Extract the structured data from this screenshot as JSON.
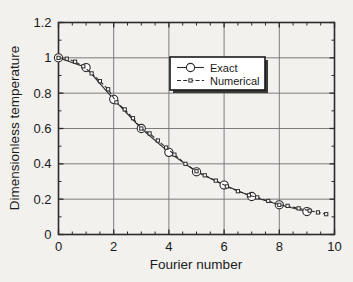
{
  "chart_data": {
    "type": "line",
    "title": "",
    "xlabel": "Fourier number",
    "ylabel": "Dimensionless temperature",
    "xlim": [
      0,
      10
    ],
    "ylim": [
      0,
      1.2
    ],
    "xticks": [
      0,
      2,
      4,
      6,
      8,
      10
    ],
    "xtick_labels": [
      "0",
      "2",
      "4",
      "6",
      "8",
      "10"
    ],
    "yticks": [
      0,
      0.2,
      0.4,
      0.6,
      0.8,
      1,
      1.2
    ],
    "ytick_labels": [
      "0",
      "0.2",
      "0.4",
      "0.6",
      "0.8",
      "1",
      "1.2"
    ],
    "xminor_ticks": [
      0.5,
      1,
      1.5,
      2.5,
      3,
      3.5,
      4.5,
      5,
      5.5,
      6.5,
      7,
      7.5,
      8.5,
      9,
      9.5
    ],
    "yminor_ticks": [
      0.1,
      0.3,
      0.5,
      0.7,
      0.9,
      1.1
    ],
    "grid": true,
    "grid_color": "#6e6e6e",
    "legend_position": "upper-center",
    "series": [
      {
        "name": "Exact",
        "marker": "circle",
        "linestyle": "solid",
        "color": "#2b2b2b",
        "x": [
          0,
          1,
          2,
          3,
          4,
          5,
          6,
          7,
          8,
          9
        ],
        "y": [
          1.0,
          0.945,
          0.765,
          0.6,
          0.465,
          0.355,
          0.28,
          0.215,
          0.168,
          0.13
        ]
      },
      {
        "name": "Numerical",
        "marker": "square",
        "linestyle": "dashed",
        "color": "#2b2b2b",
        "x": [
          0,
          0.3,
          0.6,
          0.9,
          1.2,
          1.5,
          1.8,
          2.1,
          2.4,
          2.7,
          3.0,
          3.3,
          3.6,
          3.9,
          4.2,
          4.6,
          5.0,
          5.3,
          5.7,
          6.1,
          6.5,
          6.9,
          7.2,
          7.6,
          8.0,
          8.3,
          8.7,
          9.1,
          9.4,
          9.7
        ],
        "y": [
          1.0,
          0.995,
          0.978,
          0.952,
          0.912,
          0.868,
          0.822,
          0.748,
          0.708,
          0.658,
          0.6,
          0.572,
          0.532,
          0.492,
          0.452,
          0.4,
          0.358,
          0.335,
          0.305,
          0.272,
          0.245,
          0.222,
          0.21,
          0.19,
          0.168,
          0.162,
          0.148,
          0.135,
          0.125,
          0.115
        ]
      }
    ]
  },
  "legend": {
    "entries": [
      {
        "label": "Exact",
        "marker": "circle",
        "linestyle": "solid"
      },
      {
        "label": "Numerical",
        "marker": "square",
        "linestyle": "dashed"
      }
    ]
  }
}
